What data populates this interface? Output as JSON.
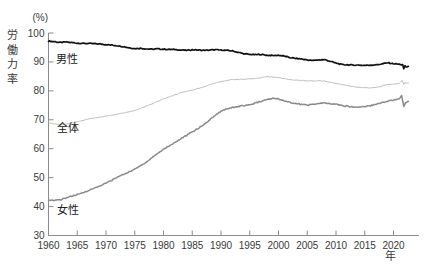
{
  "chart_data": {
    "type": "line",
    "title": "",
    "unit": "(%)",
    "ylabel": "労働力率",
    "xlabel": "年",
    "x_range": [
      1960,
      2022.6
    ],
    "ylim": [
      30,
      100
    ],
    "x_ticks": [
      1960,
      1965,
      1970,
      1975,
      1980,
      1985,
      1990,
      1995,
      2000,
      2005,
      2010,
      2015,
      2020
    ],
    "y_ticks": [
      30,
      40,
      50,
      60,
      70,
      80,
      90,
      100
    ],
    "grid": false,
    "legend_position": "inline-next-to-lines",
    "series": [
      {
        "name": "男性",
        "color": "#111111",
        "points": [
          [
            1960,
            97.2
          ],
          [
            1961,
            97.0
          ],
          [
            1962,
            96.7
          ],
          [
            1963,
            96.9
          ],
          [
            1964,
            96.7
          ],
          [
            1965,
            96.5
          ],
          [
            1966,
            96.4
          ],
          [
            1967,
            96.4
          ],
          [
            1968,
            96.3
          ],
          [
            1969,
            96.2
          ],
          [
            1970,
            96.0
          ],
          [
            1971,
            95.8
          ],
          [
            1972,
            95.6
          ],
          [
            1973,
            95.3
          ],
          [
            1974,
            94.9
          ],
          [
            1975,
            94.6
          ],
          [
            1976,
            94.7
          ],
          [
            1977,
            94.5
          ],
          [
            1978,
            94.4
          ],
          [
            1979,
            94.5
          ],
          [
            1980,
            94.4
          ],
          [
            1981,
            94.3
          ],
          [
            1982,
            94.3
          ],
          [
            1983,
            94.1
          ],
          [
            1984,
            94.0
          ],
          [
            1985,
            94.2
          ],
          [
            1986,
            94.1
          ],
          [
            1987,
            94.0
          ],
          [
            1988,
            94.1
          ],
          [
            1989,
            94.2
          ],
          [
            1990,
            94.1
          ],
          [
            1991,
            94.0
          ],
          [
            1992,
            93.8
          ],
          [
            1993,
            93.3
          ],
          [
            1994,
            92.8
          ],
          [
            1995,
            92.6
          ],
          [
            1996,
            92.5
          ],
          [
            1997,
            92.6
          ],
          [
            1998,
            92.3
          ],
          [
            1999,
            92.2
          ],
          [
            2000,
            92.3
          ],
          [
            2001,
            92.0
          ],
          [
            2002,
            91.5
          ],
          [
            2003,
            91.2
          ],
          [
            2004,
            91.0
          ],
          [
            2005,
            90.7
          ],
          [
            2006,
            90.5
          ],
          [
            2007,
            90.7
          ],
          [
            2008,
            90.8
          ],
          [
            2009,
            90.2
          ],
          [
            2010,
            89.6
          ],
          [
            2011,
            89.1
          ],
          [
            2012,
            89.0
          ],
          [
            2013,
            88.9
          ],
          [
            2014,
            88.9
          ],
          [
            2015,
            88.8
          ],
          [
            2016,
            88.9
          ],
          [
            2017,
            89.0
          ],
          [
            2018,
            89.3
          ],
          [
            2019,
            89.7
          ],
          [
            2020,
            89.4
          ],
          [
            2021,
            89.2
          ],
          [
            2021.6,
            89.0
          ],
          [
            2021.8,
            87.5
          ],
          [
            2022.0,
            88.7
          ],
          [
            2022.2,
            88.2
          ],
          [
            2022.6,
            88.5
          ]
        ]
      },
      {
        "name": "全体",
        "color": "#b4b4b4",
        "points": [
          [
            1960,
            69.0
          ],
          [
            1961,
            68.6
          ],
          [
            1962,
            68.4
          ],
          [
            1963,
            68.5
          ],
          [
            1964,
            68.9
          ],
          [
            1965,
            69.3
          ],
          [
            1966,
            69.8
          ],
          [
            1967,
            70.3
          ],
          [
            1968,
            70.6
          ],
          [
            1969,
            70.9
          ],
          [
            1970,
            71.3
          ],
          [
            1971,
            71.6
          ],
          [
            1972,
            71.9
          ],
          [
            1973,
            72.4
          ],
          [
            1974,
            72.7
          ],
          [
            1975,
            73.2
          ],
          [
            1976,
            73.9
          ],
          [
            1977,
            74.7
          ],
          [
            1978,
            75.5
          ],
          [
            1979,
            76.4
          ],
          [
            1980,
            77.2
          ],
          [
            1981,
            77.9
          ],
          [
            1982,
            78.6
          ],
          [
            1983,
            79.3
          ],
          [
            1984,
            79.8
          ],
          [
            1985,
            80.3
          ],
          [
            1986,
            80.8
          ],
          [
            1987,
            81.4
          ],
          [
            1988,
            82.1
          ],
          [
            1989,
            82.7
          ],
          [
            1990,
            83.2
          ],
          [
            1991,
            83.6
          ],
          [
            1992,
            83.9
          ],
          [
            1993,
            84.0
          ],
          [
            1994,
            84.0
          ],
          [
            1995,
            84.1
          ],
          [
            1996,
            84.3
          ],
          [
            1997,
            84.6
          ],
          [
            1998,
            84.9
          ],
          [
            1999,
            84.8
          ],
          [
            2000,
            84.6
          ],
          [
            2001,
            84.2
          ],
          [
            2002,
            83.9
          ],
          [
            2003,
            83.7
          ],
          [
            2004,
            83.6
          ],
          [
            2005,
            83.5
          ],
          [
            2006,
            83.4
          ],
          [
            2007,
            83.5
          ],
          [
            2008,
            83.4
          ],
          [
            2009,
            83.0
          ],
          [
            2010,
            82.6
          ],
          [
            2011,
            82.2
          ],
          [
            2012,
            81.8
          ],
          [
            2013,
            81.5
          ],
          [
            2014,
            81.2
          ],
          [
            2015,
            81.1
          ],
          [
            2016,
            81.0
          ],
          [
            2017,
            81.2
          ],
          [
            2018,
            81.7
          ],
          [
            2019,
            82.2
          ],
          [
            2020,
            82.3
          ],
          [
            2021,
            82.6
          ],
          [
            2021.5,
            83.6
          ],
          [
            2021.8,
            82.3
          ],
          [
            2022.0,
            82.8
          ],
          [
            2022.6,
            82.7
          ]
        ]
      },
      {
        "name": "女性",
        "color": "#8a8a8a",
        "points": [
          [
            1960,
            42.4
          ],
          [
            1961,
            42.1
          ],
          [
            1962,
            42.3
          ],
          [
            1963,
            43.0
          ],
          [
            1964,
            43.6
          ],
          [
            1965,
            44.1
          ],
          [
            1966,
            44.8
          ],
          [
            1967,
            45.6
          ],
          [
            1968,
            46.4
          ],
          [
            1969,
            47.2
          ],
          [
            1970,
            48.1
          ],
          [
            1971,
            49.1
          ],
          [
            1972,
            50.2
          ],
          [
            1973,
            51.1
          ],
          [
            1974,
            52.0
          ],
          [
            1975,
            52.9
          ],
          [
            1976,
            54.1
          ],
          [
            1977,
            55.4
          ],
          [
            1978,
            56.9
          ],
          [
            1979,
            58.4
          ],
          [
            1980,
            59.8
          ],
          [
            1981,
            61.0
          ],
          [
            1982,
            62.2
          ],
          [
            1983,
            63.4
          ],
          [
            1984,
            64.6
          ],
          [
            1985,
            65.8
          ],
          [
            1986,
            67.0
          ],
          [
            1987,
            68.3
          ],
          [
            1988,
            69.9
          ],
          [
            1989,
            71.6
          ],
          [
            1990,
            73.0
          ],
          [
            1991,
            73.8
          ],
          [
            1992,
            74.3
          ],
          [
            1993,
            74.6
          ],
          [
            1994,
            74.9
          ],
          [
            1995,
            75.1
          ],
          [
            1996,
            75.8
          ],
          [
            1997,
            76.4
          ],
          [
            1998,
            77.0
          ],
          [
            1999,
            77.4
          ],
          [
            2000,
            77.2
          ],
          [
            2001,
            76.6
          ],
          [
            2002,
            76.0
          ],
          [
            2003,
            75.6
          ],
          [
            2004,
            75.3
          ],
          [
            2005,
            75.1
          ],
          [
            2006,
            75.3
          ],
          [
            2007,
            75.6
          ],
          [
            2008,
            75.8
          ],
          [
            2009,
            75.5
          ],
          [
            2010,
            75.4
          ],
          [
            2011,
            74.9
          ],
          [
            2012,
            74.7
          ],
          [
            2013,
            74.4
          ],
          [
            2014,
            74.4
          ],
          [
            2015,
            74.6
          ],
          [
            2016,
            74.9
          ],
          [
            2017,
            75.4
          ],
          [
            2018,
            75.9
          ],
          [
            2019,
            76.5
          ],
          [
            2020,
            76.8
          ],
          [
            2021,
            77.2
          ],
          [
            2021.4,
            78.3
          ],
          [
            2021.8,
            74.7
          ],
          [
            2022.1,
            75.9
          ],
          [
            2022.6,
            76.4
          ]
        ]
      }
    ]
  }
}
